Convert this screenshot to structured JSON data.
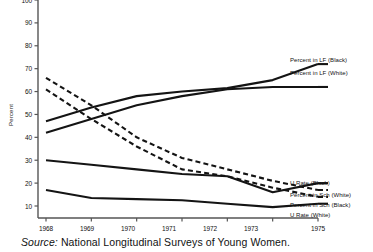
{
  "axis": {
    "ylabel": "Percent",
    "yticks": [
      100,
      90,
      80,
      70,
      60,
      50,
      40,
      30,
      20,
      10
    ],
    "xticks": [
      "1968",
      "1969",
      "1970",
      "1971",
      "1972",
      "1973",
      "1975"
    ]
  },
  "legend": {
    "lf_black": "Percent in LF (Black)",
    "lf_white": "Percent in LF (White)",
    "u_black": "U Rate (Black)",
    "sch_white": "Percent in Sch (White)",
    "sch_black": "Percent in Sch (Black)",
    "u_white": "U Rate (White)"
  },
  "source": {
    "prefix": "Source:",
    "text": "National Longitudinal Surveys of Young Women."
  },
  "colors": {
    "line": "#141414",
    "axis": "#555555",
    "background": "#ffffff"
  },
  "chart_data": {
    "type": "line",
    "title": "",
    "xlabel": "",
    "ylabel": "Percent",
    "ylim": [
      0,
      100
    ],
    "grid": false,
    "legend_position": "right-inline",
    "x": [
      1968,
      1969,
      1970,
      1971,
      1972,
      1973,
      1975
    ],
    "xtick_labels": [
      "1968",
      "1969",
      "1970",
      "1971",
      "1972",
      "1973",
      "1975"
    ],
    "ytick_labels": [
      "10",
      "20",
      "30",
      "40",
      "50",
      "60",
      "70",
      "80",
      "90",
      "100"
    ],
    "series": [
      {
        "name": "Percent in LF (Black)",
        "style": "solid",
        "values": [
          47,
          53,
          58,
          60,
          61.5,
          65,
          72
        ]
      },
      {
        "name": "Percent in LF (White)",
        "style": "solid",
        "values": [
          42,
          48,
          54,
          58,
          61,
          62,
          62
        ]
      },
      {
        "name": "Percent in Sch (White)",
        "style": "dashed",
        "values": [
          66,
          54,
          40,
          31,
          26,
          21,
          17
        ]
      },
      {
        "name": "Percent in Sch (Black)",
        "style": "dashed",
        "values": [
          61,
          48,
          36,
          26,
          23,
          18,
          14
        ]
      },
      {
        "name": "U Rate (Black)",
        "style": "solid",
        "values": [
          30,
          28,
          26,
          24,
          23,
          16,
          20
        ]
      },
      {
        "name": "U Rate (White)",
        "style": "solid",
        "values": [
          17,
          13.5,
          13,
          12.5,
          11,
          9.5,
          11
        ]
      }
    ]
  }
}
